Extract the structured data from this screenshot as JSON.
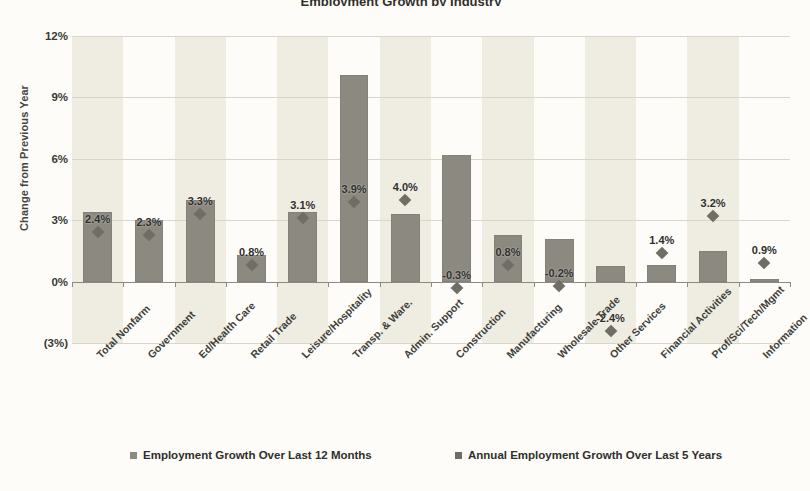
{
  "chart_data": {
    "type": "bar",
    "title": "Employment Growth by Industry",
    "xlabel": "",
    "ylabel": "Change from Previous Year",
    "ylim": [
      -3,
      12
    ],
    "yticks": [
      12,
      9,
      6,
      3,
      0,
      -3
    ],
    "ytick_labels": [
      "12%",
      "9%",
      "6%",
      "3%",
      "0%",
      "(3%)"
    ],
    "grid": true,
    "legend_position": "bottom",
    "categories": [
      "Total Nonfarm",
      "Government",
      "Ed/Health Care",
      "Retail Trade",
      "Leisure/Hospitality",
      "Transp. & Ware.",
      "Admin. Support",
      "Construction",
      "Manufacturing",
      "Wholesale Trade",
      "Other Services",
      "Financial Activities",
      "Prof/Sci/Tech/Mgmt",
      "Information"
    ],
    "series": [
      {
        "name": "Employment Growth Over Last 12 Months",
        "type": "bar",
        "color": "#8b8980",
        "values": [
          3.4,
          3.0,
          4.0,
          1.3,
          3.4,
          10.1,
          3.3,
          6.2,
          2.3,
          2.1,
          0.75,
          0.8,
          1.5,
          0.15
        ]
      },
      {
        "name": "Annual Employment Growth Over Last 5 Years",
        "type": "scatter",
        "color": "#6f6d64",
        "values": [
          2.4,
          2.3,
          3.3,
          0.8,
          3.1,
          3.9,
          4.0,
          -0.3,
          0.8,
          -0.2,
          -2.4,
          1.4,
          3.2,
          0.9
        ],
        "data_labels": [
          "2.4%",
          "2.3%",
          "3.3%",
          "0.8%",
          "3.1%",
          "3.9%",
          "4.0%",
          "-0.3%",
          "0.8%",
          "-0.2%",
          "-2.4%",
          "1.4%",
          "3.2%",
          "0.9%"
        ]
      }
    ]
  },
  "legend": {
    "items": [
      {
        "label": "Employment Growth Over Last 12 Months"
      },
      {
        "label": "Annual Employment Growth Over Last 5 Years"
      }
    ]
  }
}
